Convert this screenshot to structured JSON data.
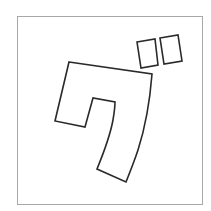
{
  "glyph": {
    "character": "グ",
    "description": "Katakana glyph outline (ku with dakuten)",
    "frame_color": "#a8a8a8",
    "stroke_color": "#2a2a2a",
    "fill_color": "#ffffff",
    "frame": {
      "x": 17,
      "y": 16,
      "width": 185,
      "height": 188
    },
    "body_path": "M69,62 L152,74 C150,100 146,125 138,150 C134,162 130,172 126,182 L97,169 C104,152 110,136 113,120 C114,114 115,108 115,102 L93,98 L85,127 L55,121 Z",
    "dakuten_left": "M137,42 L155,39 L158,65 L141,68 Z",
    "dakuten_right": "M160,38 L178,35 L182,61 L164,64 Z"
  }
}
